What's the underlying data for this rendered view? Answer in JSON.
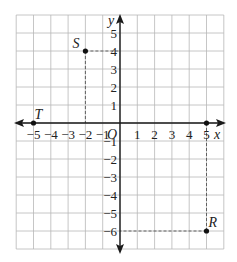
{
  "figure": {
    "x_axis_label": "x",
    "y_axis_label": "y",
    "origin_label": "O",
    "x_ticks": [
      "-5",
      "-4",
      "-3",
      "-2",
      "-1",
      "1",
      "2",
      "3",
      "4",
      "5"
    ],
    "y_ticks_positive": [
      "5",
      "4",
      "3",
      "2",
      "1"
    ],
    "y_ticks_negative": [
      "-1",
      "-2",
      "-3",
      "-4",
      "-5",
      "-6"
    ],
    "grid_range": {
      "x": [
        -6,
        6
      ],
      "y": [
        -7,
        6
      ]
    },
    "points": [
      {
        "name": "S",
        "x": -2,
        "y": 4
      },
      {
        "name": "T",
        "x": -5,
        "y": 0
      },
      {
        "name": "R",
        "x": 5,
        "y": -6
      },
      {
        "name": "",
        "x": 5,
        "y": 0
      }
    ],
    "colors": {
      "grid": "#b8b8b8",
      "axis": "#1a1a1a",
      "dash": "#555555"
    }
  }
}
